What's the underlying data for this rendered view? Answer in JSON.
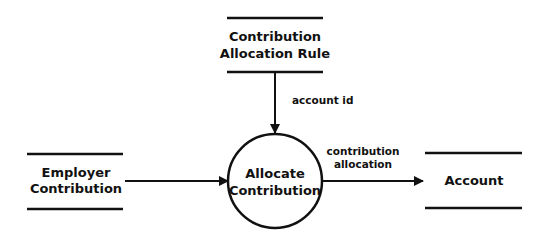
{
  "diagram": {
    "type": "data-flow-diagram",
    "colors": {
      "stroke": "#111111",
      "background": "#ffffff",
      "text": "#111111"
    },
    "process": {
      "id": "allocate-contribution",
      "lines": [
        "Allocate",
        "Contribution"
      ]
    },
    "stores": [
      {
        "id": "contribution-allocation-rule",
        "lines": [
          "Contribution",
          "Allocation Rule"
        ]
      },
      {
        "id": "employer-contribution",
        "lines": [
          "Employer",
          "Contribution"
        ]
      },
      {
        "id": "account",
        "lines": [
          "Account"
        ]
      }
    ],
    "flows": [
      {
        "from": "contribution-allocation-rule",
        "to": "allocate-contribution",
        "lines": [
          "account id"
        ]
      },
      {
        "from": "employer-contribution",
        "to": "allocate-contribution",
        "lines": []
      },
      {
        "from": "allocate-contribution",
        "to": "account",
        "lines": [
          "contribution",
          "allocation"
        ]
      }
    ]
  }
}
